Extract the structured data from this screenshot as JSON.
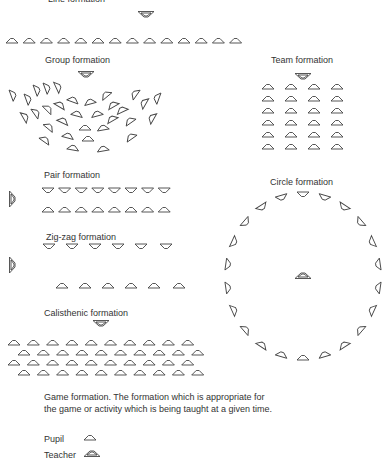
{
  "labels": {
    "line": "Line formation",
    "group": "Group formation",
    "team": "Team formation",
    "pair": "Pair formation",
    "circle": "Circle formation",
    "zigzag": "Zig-zag formation",
    "calisthenic": "Calisthenic formation",
    "game": "Game formation.  The formation which is appropriate for the game or activity which is being taught at a given time.",
    "legend_pupil": "Pupil",
    "legend_teacher": "Teacher"
  },
  "formations": {
    "line": {
      "teacher": [
        146,
        14
      ],
      "pupils_row_y": 41,
      "pupils_x_start": 12,
      "pupils_step": 17.2,
      "pupils_count": 14
    },
    "team": {
      "teacher": [
        303,
        76
      ],
      "cols": [
        268,
        291,
        314,
        337
      ],
      "rows": [
        87,
        99,
        111,
        123,
        135,
        147
      ]
    },
    "pair": {
      "teacher_side": [
        12,
        199
      ],
      "top_row_y": 190,
      "bottom_row_y": 210,
      "x_start": 48,
      "step": 16.6,
      "count": 8
    },
    "zigzag": {
      "teacher_side": [
        12,
        265
      ],
      "top_row_y": 246,
      "bottom_row_y": 286,
      "top_x": [
        49,
        72,
        95,
        118,
        141,
        166
      ],
      "bottom_x": [
        62,
        85,
        108,
        131,
        154,
        179
      ]
    },
    "calisthenic": {
      "teacher": [
        101,
        323
      ],
      "rows": [
        {
          "y": 343,
          "x_start": 14,
          "count": 10
        },
        {
          "y": 353,
          "x_start": 24,
          "count": 10
        },
        {
          "y": 363,
          "x_start": 14,
          "count": 10
        },
        {
          "y": 373,
          "x_start": 24,
          "count": 10
        }
      ],
      "step": 19.3
    },
    "circle": {
      "center": [
        303,
        276
      ],
      "rx": 76,
      "ry": 82,
      "count": 22,
      "teacher": [
        303,
        276
      ]
    }
  }
}
